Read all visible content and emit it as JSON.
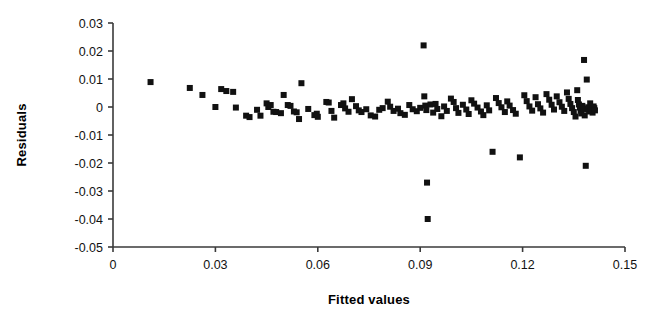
{
  "chart_data": {
    "type": "scatter",
    "title": "",
    "xlabel": "Fitted values",
    "ylabel": "Residuals",
    "xlim": [
      0,
      0.15
    ],
    "ylim": [
      -0.05,
      0.03
    ],
    "xticks": [
      0,
      0.03,
      0.06,
      0.09,
      0.12,
      0.15
    ],
    "xtick_labels": [
      "0",
      "0.03",
      "0.06",
      "0.09",
      "0.12",
      "0.15"
    ],
    "yticks": [
      0.03,
      0.02,
      0.01,
      0,
      -0.01,
      -0.02,
      -0.03,
      -0.04,
      -0.05
    ],
    "ytick_labels": [
      "0.03",
      "0.02",
      "0.01",
      "0",
      "-0.01",
      "-0.02",
      "-0.03",
      "-0.04",
      "-0.05"
    ],
    "grid": false,
    "legend": null,
    "marker": {
      "shape": "square",
      "color": "#111111",
      "size": 6
    },
    "series": [
      {
        "name": "residuals",
        "points": [
          [
            0.011,
            0.0089
          ],
          [
            0.0225,
            0.0068
          ],
          [
            0.0262,
            0.0043
          ],
          [
            0.03,
            0.0
          ],
          [
            0.0317,
            0.0064
          ],
          [
            0.0332,
            0.0057
          ],
          [
            0.0352,
            0.0054
          ],
          [
            0.036,
            -0.0002
          ],
          [
            0.039,
            -0.0031
          ],
          [
            0.04,
            -0.0036
          ],
          [
            0.0422,
            -0.001
          ],
          [
            0.0432,
            -0.0031
          ],
          [
            0.045,
            0.0013
          ],
          [
            0.0455,
            0.0
          ],
          [
            0.0462,
            0.0007
          ],
          [
            0.047,
            -0.0017
          ],
          [
            0.0478,
            -0.0018
          ],
          [
            0.0492,
            -0.0022
          ],
          [
            0.05,
            0.0043
          ],
          [
            0.0512,
            0.0007
          ],
          [
            0.052,
            0.0004
          ],
          [
            0.053,
            -0.0016
          ],
          [
            0.0538,
            -0.0019
          ],
          [
            0.0545,
            -0.0043
          ],
          [
            0.0552,
            0.0085
          ],
          [
            0.0572,
            -0.0007
          ],
          [
            0.059,
            -0.0029
          ],
          [
            0.0597,
            -0.0024
          ],
          [
            0.06,
            -0.0035
          ],
          [
            0.0625,
            0.0018
          ],
          [
            0.0632,
            0.0016
          ],
          [
            0.064,
            -0.0014
          ],
          [
            0.0648,
            -0.0038
          ],
          [
            0.0668,
            0.0007
          ],
          [
            0.0675,
            0.0013
          ],
          [
            0.068,
            -0.0005
          ],
          [
            0.069,
            -0.0017
          ],
          [
            0.07,
            0.0028
          ],
          [
            0.0712,
            0.0003
          ],
          [
            0.072,
            -0.0012
          ],
          [
            0.0728,
            -0.0018
          ],
          [
            0.0742,
            -0.0008
          ],
          [
            0.0755,
            -0.003
          ],
          [
            0.0768,
            -0.0034
          ],
          [
            0.078,
            -0.001
          ],
          [
            0.079,
            -0.0004
          ],
          [
            0.0805,
            0.0019
          ],
          [
            0.0812,
            0.0001
          ],
          [
            0.0822,
            -0.0014
          ],
          [
            0.0835,
            -0.0006
          ],
          [
            0.0842,
            -0.0022
          ],
          [
            0.0855,
            -0.0028
          ],
          [
            0.0868,
            0.0007
          ],
          [
            0.0878,
            -0.0008
          ],
          [
            0.089,
            -0.0015
          ],
          [
            0.09,
            -0.0003
          ],
          [
            0.091,
            0.022
          ],
          [
            0.0912,
            0.0038
          ],
          [
            0.0915,
            0.0005
          ],
          [
            0.0918,
            -0.0011
          ],
          [
            0.092,
            -0.027
          ],
          [
            0.0922,
            -0.04
          ],
          [
            0.093,
            0.0009
          ],
          [
            0.0938,
            -0.002
          ],
          [
            0.0945,
            0.0011
          ],
          [
            0.095,
            -0.0007
          ],
          [
            0.0962,
            -0.0033
          ],
          [
            0.097,
            0.0002
          ],
          [
            0.0978,
            -0.0014
          ],
          [
            0.099,
            0.003
          ],
          [
            0.0998,
            0.0018
          ],
          [
            0.1005,
            -0.0004
          ],
          [
            0.1012,
            -0.0021
          ],
          [
            0.1025,
            0.0008
          ],
          [
            0.1035,
            -0.0009
          ],
          [
            0.1042,
            -0.0025
          ],
          [
            0.105,
            0.0024
          ],
          [
            0.1058,
            0.0012
          ],
          [
            0.1068,
            -0.0002
          ],
          [
            0.1078,
            -0.0016
          ],
          [
            0.1085,
            -0.0029
          ],
          [
            0.1095,
            0.0006
          ],
          [
            0.1102,
            -0.0012
          ],
          [
            0.1112,
            -0.016
          ],
          [
            0.1122,
            0.0032
          ],
          [
            0.113,
            0.0014
          ],
          [
            0.1138,
            -0.0001
          ],
          [
            0.1148,
            -0.0018
          ],
          [
            0.1155,
            0.002
          ],
          [
            0.1162,
            0.0005
          ],
          [
            0.1172,
            -0.0011
          ],
          [
            0.118,
            -0.0024
          ],
          [
            0.1192,
            -0.018
          ],
          [
            0.1205,
            0.0042
          ],
          [
            0.1212,
            0.0021
          ],
          [
            0.122,
            0.0002
          ],
          [
            0.1228,
            -0.0013
          ],
          [
            0.1238,
            0.0035
          ],
          [
            0.1245,
            0.001
          ],
          [
            0.1252,
            -0.0005
          ],
          [
            0.126,
            -0.002
          ],
          [
            0.127,
            0.0046
          ],
          [
            0.1278,
            0.0026
          ],
          [
            0.1285,
            0.0008
          ],
          [
            0.1292,
            -0.0009
          ],
          [
            0.13,
            0.0038
          ],
          [
            0.1308,
            0.0017
          ],
          [
            0.1315,
            0.0001
          ],
          [
            0.1322,
            -0.0014
          ],
          [
            0.133,
            0.0052
          ],
          [
            0.1335,
            0.0029
          ],
          [
            0.134,
            0.0011
          ],
          [
            0.1345,
            -0.0004
          ],
          [
            0.135,
            -0.0018
          ],
          [
            0.1355,
            -0.0034
          ],
          [
            0.136,
            0.006
          ],
          [
            0.1362,
            0.0025
          ],
          [
            0.1365,
            0.0009
          ],
          [
            0.1368,
            -0.0002
          ],
          [
            0.137,
            -0.0013
          ],
          [
            0.1372,
            -0.0023
          ],
          [
            0.1375,
            0.0004
          ],
          [
            0.1378,
            -0.0007
          ],
          [
            0.138,
            0.0168
          ],
          [
            0.1382,
            -0.003
          ],
          [
            0.1385,
            -0.021
          ],
          [
            0.1388,
            0.0098
          ],
          [
            0.139,
            -0.0008
          ],
          [
            0.1392,
            -0.0001
          ],
          [
            0.1395,
            -0.0016
          ],
          [
            0.1398,
            0.0013
          ],
          [
            0.14,
            -0.0005
          ],
          [
            0.1402,
            -0.0011
          ],
          [
            0.1405,
            -0.002
          ],
          [
            0.1408,
            0.0002
          ],
          [
            0.141,
            -0.0004
          ],
          [
            0.1412,
            -0.0012
          ]
        ]
      }
    ]
  }
}
